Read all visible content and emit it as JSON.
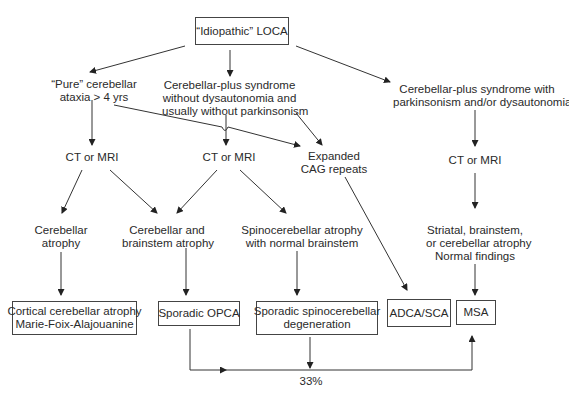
{
  "diagram": {
    "root": {
      "label": "“Idiopathic” LOCA"
    },
    "branches": {
      "pure": {
        "lines": [
          "“Pure” cerebellar",
          "ataxia > 4 yrs"
        ]
      },
      "plus_no_dys": {
        "lines": [
          "Cerebellar-plus syndrome",
          "without dysautonomia and",
          "usually without parkinsonism"
        ]
      },
      "plus_park": {
        "lines": [
          "Cerebellar-plus syndrome with",
          "parkinsonism and/or dysautonomia"
        ]
      }
    },
    "imaging": {
      "ct1": "CT or MRI",
      "ct2": "CT or MRI",
      "ct3": "CT or MRI"
    },
    "genetic": {
      "lines": [
        "Expanded",
        "CAG repeats"
      ]
    },
    "findings": {
      "cerebellar_atrophy": {
        "lines": [
          "Cerebellar",
          "atrophy"
        ]
      },
      "cereb_brainstem": {
        "lines": [
          "Cerebellar and",
          "brainstem atrophy"
        ]
      },
      "spinocerebellar": {
        "lines": [
          "Spinocerebellar atrophy",
          "with normal brainstem"
        ]
      },
      "striatal": {
        "lines": [
          "Striatal, brainstem,",
          "or cerebellar atrophy",
          "Normal findings"
        ]
      }
    },
    "outcomes": {
      "ccamfa": {
        "lines": [
          "Cortical cerebellar atrophy",
          "Marie-Foix-Alajouanine"
        ]
      },
      "opca": {
        "lines": [
          "Sporadic OPCA"
        ]
      },
      "ssd": {
        "lines": [
          "Sporadic spinocerebellar",
          "degeneration"
        ]
      },
      "adca": {
        "lines": [
          "ADCA/SCA"
        ]
      },
      "msa": {
        "lines": [
          "MSA"
        ]
      }
    },
    "conversion_label": "33%",
    "line_color": "#333333"
  }
}
